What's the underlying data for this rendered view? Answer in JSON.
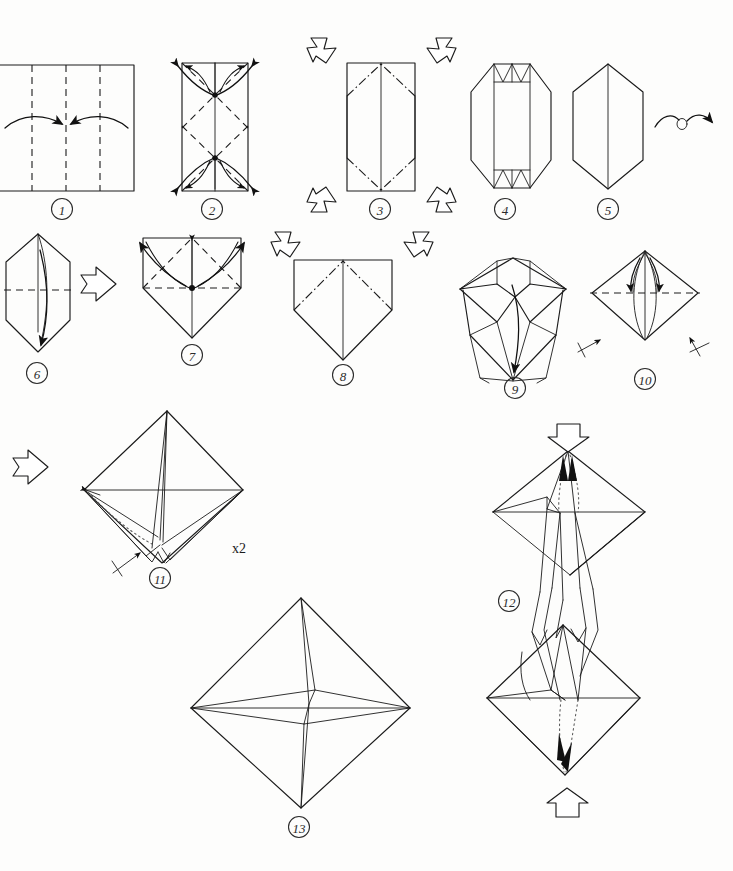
{
  "document": {
    "title": "Origami Folding Diagram",
    "kind": "origami-instruction-sheet",
    "style": "black-and-white line drawing",
    "background_color": "#fdfdfc",
    "ink_color": "#1b1b1b",
    "width": 733,
    "height": 871,
    "total_steps": 13
  },
  "legend": {
    "valley_fold": "dashed line",
    "mountain_fold": "dash-dot line",
    "hidden_edge": "dotted line",
    "fold_arrow": "solid curved arrow",
    "push_arrow": "hollow block arrow",
    "turn_over": "looped arrow",
    "repeat_symbol": "arrow with cross stroke"
  },
  "labels": {
    "repeat_twice": "x2"
  },
  "steps": [
    {
      "number": "1",
      "caption_x": 62,
      "caption_y": 209,
      "shape": "rectangle",
      "action": "fold both side edges to the vertical center line",
      "creases": "three vertical valley folds (quarters and center)",
      "arrows": 2
    },
    {
      "number": "2",
      "caption_x": 212,
      "caption_y": 209,
      "shape": "tall rectangle",
      "action": "fold four corners outward along diagonal creases",
      "creases": "four diagonal valley folds, vertical center line",
      "arrows": 4,
      "reference_points": 2
    },
    {
      "number": "3",
      "caption_x": 380,
      "caption_y": 209,
      "shape": "rectangle with mountain diagonals",
      "action": "push in the four corners",
      "creases": "four diagonal mountain folds",
      "arrows": 4,
      "arrow_style": "hollow push arrows at all four corners"
    },
    {
      "number": "4",
      "caption_x": 505,
      "caption_y": 209,
      "shape": "hexagonal form with pleats",
      "action": "result after collapsing the corners",
      "arrows": 0
    },
    {
      "number": "5",
      "caption_x": 608,
      "caption_y": 209,
      "shape": "hexagon with vertical center line",
      "action": "turn the model over",
      "arrows": 1,
      "arrow_style": "looped turn-over arrow"
    },
    {
      "number": "6",
      "caption_x": 37,
      "caption_y": 373,
      "shape": "hexagon",
      "action": "fold the top half down behind",
      "creases": "horizontal valley fold across the middle",
      "arrows": 1
    },
    {
      "number": "7",
      "caption_x": 192,
      "caption_y": 355,
      "shape": "house / pentagon form",
      "action": "fold the two upper flaps outward and up",
      "creases": "two diagonal valley folds",
      "arrows": 2,
      "reference_points": 1
    },
    {
      "number": "8",
      "caption_x": 343,
      "caption_y": 375,
      "shape": "pentagon with mountain diagonals",
      "action": "push the two upper corners inward",
      "creases": "two diagonal mountain folds",
      "arrows": 2,
      "arrow_style": "hollow push arrows"
    },
    {
      "number": "9",
      "caption_x": 515,
      "caption_y": 388,
      "shape": "double-pointed star form",
      "action": "pull the inner point down",
      "arrows": 1
    },
    {
      "number": "10",
      "caption_x": 645,
      "caption_y": 379,
      "shape": "diamond / kite",
      "action": "fold both inner flaps down; repeat behind",
      "creases": "horizontal valley fold",
      "arrows": 2,
      "repeat_marks": 2
    },
    {
      "number": "11",
      "caption_x": 160,
      "caption_y": 578,
      "shape": "three-dimensional octahedral form",
      "action": "swing the front flap across; repeat",
      "arrows": 1,
      "repeat_marks": 1,
      "note": "x2"
    },
    {
      "number": "12",
      "caption_x": 509,
      "caption_y": 601,
      "shape": "double cone, elongated",
      "action": "push the top and bottom points together to inflate",
      "arrows": 4,
      "arrow_style": "two hollow push arrows plus inner fold arrows"
    },
    {
      "number": "13",
      "caption_x": 299,
      "caption_y": 827,
      "shape": "finished octahedron / star",
      "action": "completed model",
      "arrows": 0
    }
  ]
}
